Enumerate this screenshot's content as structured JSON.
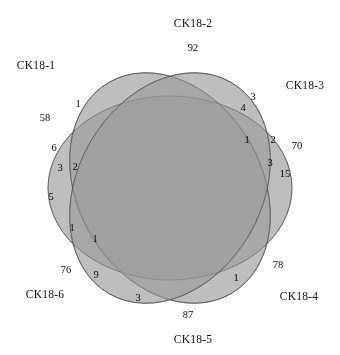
{
  "figure": {
    "type": "venn",
    "set_count": 6,
    "background_color": "#ffffff",
    "fill_color": "#9d9d9d",
    "outline_color": "#4a4a4a"
  },
  "sets": [
    {
      "name": "CK18-1",
      "label_x": 36,
      "label_y": 65,
      "angle": 180
    },
    {
      "name": "CK18-2",
      "label_x": 193,
      "label_y": 23,
      "angle": 240
    },
    {
      "name": "CK18-3",
      "label_x": 305,
      "label_y": 85,
      "angle": 300
    },
    {
      "name": "CK18-4",
      "label_x": 299,
      "label_y": 296,
      "angle": 0
    },
    {
      "name": "CK18-5",
      "label_x": 193,
      "label_y": 339,
      "angle": 60
    },
    {
      "name": "CK18-6",
      "label_x": 45,
      "label_y": 294,
      "angle": 120
    }
  ],
  "chart_data": {
    "type": "venn",
    "title": "",
    "sets": [
      "CK18-1",
      "CK18-2",
      "CK18-3",
      "CK18-4",
      "CK18-5",
      "CK18-6"
    ],
    "regions": [
      {
        "value": "58",
        "x": 45,
        "y": 117
      },
      {
        "value": "1",
        "x": 78,
        "y": 103
      },
      {
        "value": "92",
        "x": 193,
        "y": 47
      },
      {
        "value": "3",
        "x": 253,
        "y": 96
      },
      {
        "value": "4",
        "x": 243,
        "y": 107
      },
      {
        "value": "70",
        "x": 297,
        "y": 145
      },
      {
        "value": "2",
        "x": 273,
        "y": 139
      },
      {
        "value": "1",
        "x": 247,
        "y": 139
      },
      {
        "value": "3",
        "x": 270,
        "y": 162
      },
      {
        "value": "15",
        "x": 285,
        "y": 173
      },
      {
        "value": "6",
        "x": 54,
        "y": 147
      },
      {
        "value": "3",
        "x": 60,
        "y": 167
      },
      {
        "value": "2",
        "x": 75,
        "y": 166
      },
      {
        "value": "5",
        "x": 51,
        "y": 196
      },
      {
        "value": "1",
        "x": 72,
        "y": 227
      },
      {
        "value": "1",
        "x": 95,
        "y": 238
      },
      {
        "value": "76",
        "x": 66,
        "y": 269
      },
      {
        "value": "9",
        "x": 96,
        "y": 274
      },
      {
        "value": "3",
        "x": 138,
        "y": 297
      },
      {
        "value": "87",
        "x": 188,
        "y": 314
      },
      {
        "value": "1",
        "x": 236,
        "y": 277
      },
      {
        "value": "78",
        "x": 278,
        "y": 264
      }
    ]
  }
}
